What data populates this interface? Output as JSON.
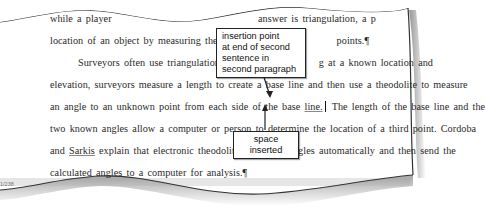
{
  "document": {
    "lines": [
      {
        "pre": "while  a player  ",
        "hidden_mid": "",
        "post": "answer  is  triangulation,  a  p"
      },
      {
        "text": "location  of  an  object  by  measuring  the  angles",
        "tail": "points.",
        "pilcrow": "¶"
      },
      {
        "text": "Surveyors  often  use  triangulation  to  m",
        "tail": "g  at  a  known  location  and"
      },
      {
        "text": "elevation,  surveyors  measure  a  length  to  create  a  base  line  and  then  use  a  theodolite  to  measure"
      },
      {
        "pre": "an  angle  to  an  unknown  point  from  each  side  of  the  base  ",
        "underlined": "line.",
        "post": "  The  length  of  the  base  line  and  the"
      },
      {
        "text": "two  known  angles  allow  a  computer  or  person  to  determine  the  location  of  a  third  point.  Cordoba"
      },
      {
        "pre": "and  ",
        "underlined": "Sarkis",
        "post": "  explain  that  electronic  theodolites  calculate  angles  automatically  and  then  send  the"
      },
      {
        "text": "calculated  angles  to  a  computer  for  analysis.",
        "pilcrow": "¶"
      }
    ]
  },
  "callouts": {
    "insertion_point": [
      "insertion point",
      "at end of second",
      "sentence in",
      "second paragraph"
    ],
    "space_inserted": "space inserted"
  },
  "status_bar": {
    "words": "1/238"
  },
  "colors": {
    "text": "#2a2a2a",
    "callout_border": "#222222",
    "shadow": "#9a9a9a"
  }
}
